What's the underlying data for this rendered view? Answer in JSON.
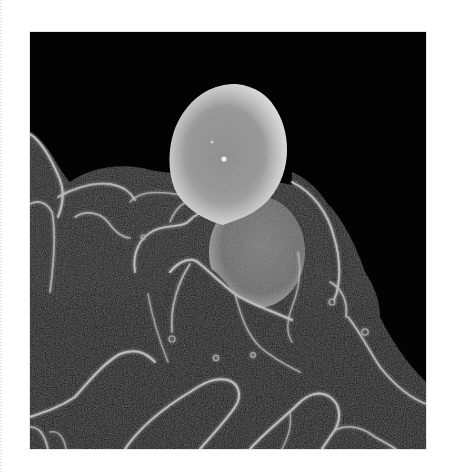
{
  "image": {
    "type": "scanning-electron-micrograph",
    "description": "Grayscale SEM image of a cell with ruffled membrane folds engulfing two spherical particles",
    "alt": "Scanning electron micrograph of a cell engulfing spherical bacteria",
    "colors": {
      "page_background": "#ffffff",
      "image_background": "#030303",
      "membrane_edge": "#c8c8c8",
      "sphere_highlight": "#dcdcdc",
      "sphere_core": "#8a8a8a",
      "lower_sphere": "#6e6e6e"
    },
    "objects": [
      {
        "name": "upper-sphere",
        "shape": "ellipse",
        "cx": 192,
        "cy": 98,
        "rx": 69,
        "ry": 76
      },
      {
        "name": "lower-sphere",
        "shape": "ellipse",
        "cx": 225,
        "cy": 216,
        "rx": 48,
        "ry": 56
      },
      {
        "name": "cell-membrane",
        "shape": "irregular-folds"
      }
    ]
  }
}
